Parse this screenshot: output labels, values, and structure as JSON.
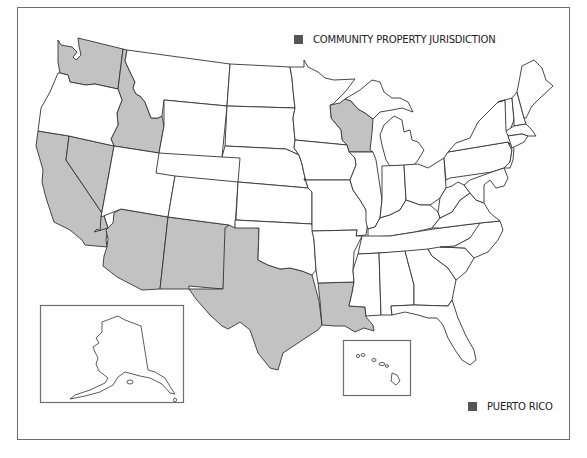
{
  "legend": {
    "community_property": {
      "label": "COMMUNITY PROPERTY JURISDICTION",
      "color": "#555555"
    },
    "puerto_rico": {
      "label": "PUERTO RICO",
      "color": "#555555"
    }
  },
  "colors": {
    "community_property_fill": "#c2c2c2",
    "other_fill": "#ffffff",
    "border": "#333333",
    "frame": "#6e6e6e"
  },
  "states": {
    "community_property": [
      "Washington",
      "Idaho",
      "California",
      "Nevada",
      "Arizona",
      "New Mexico",
      "Texas",
      "Louisiana",
      "Wisconsin"
    ],
    "other": [
      "Oregon",
      "Montana",
      "Wyoming",
      "Utah",
      "Colorado",
      "North Dakota",
      "South Dakota",
      "Nebraska",
      "Kansas",
      "Oklahoma",
      "Minnesota",
      "Iowa",
      "Missouri",
      "Arkansas",
      "Illinois",
      "Michigan",
      "Indiana",
      "Ohio",
      "Kentucky",
      "Tennessee",
      "Mississippi",
      "Alabama",
      "Georgia",
      "Florida",
      "South Carolina",
      "North Carolina",
      "Virginia",
      "West Virginia",
      "Pennsylvania",
      "New York",
      "Vermont",
      "New Hampshire",
      "Maine",
      "Massachusetts",
      "Connecticut",
      "Rhode Island",
      "New Jersey",
      "Delaware",
      "Maryland"
    ]
  },
  "insets": {
    "alaska": "Alaska",
    "hawaii": "Hawaii"
  }
}
